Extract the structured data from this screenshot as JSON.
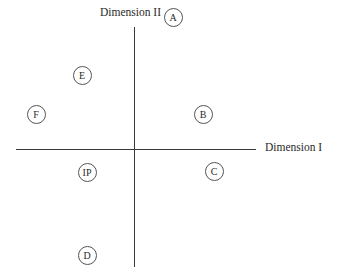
{
  "diagram": {
    "axes": {
      "x_label": "Dimension I",
      "y_label": "Dimension II"
    },
    "points": [
      {
        "label": "A",
        "x": 173,
        "y": 17
      },
      {
        "label": "E",
        "x": 82,
        "y": 75
      },
      {
        "label": "F",
        "x": 36,
        "y": 114
      },
      {
        "label": "B",
        "x": 203,
        "y": 114
      },
      {
        "label": "IP",
        "x": 87,
        "y": 172
      },
      {
        "label": "C",
        "x": 214,
        "y": 171
      },
      {
        "label": "D",
        "x": 87,
        "y": 255
      }
    ]
  }
}
